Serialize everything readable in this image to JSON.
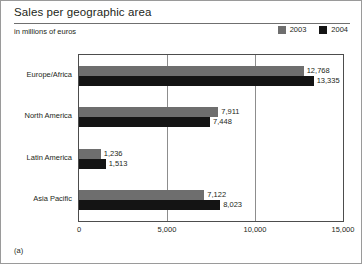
{
  "figure": {
    "title": "Sales per geographic area",
    "subtitle": "in millions of euros",
    "caption": "(a)"
  },
  "legend": {
    "position": "top-right",
    "entries": [
      {
        "label": "2003",
        "color": "#6e6e6e"
      },
      {
        "label": "2004",
        "color": "#141414"
      }
    ]
  },
  "chart_data": {
    "type": "bar",
    "orientation": "horizontal",
    "title": "Sales per geographic area",
    "subtitle": "in millions of euros",
    "xlabel": "",
    "ylabel": "",
    "xlim": [
      0,
      15000
    ],
    "xticks": [
      0,
      5000,
      10000,
      15000
    ],
    "xticklabels": [
      "0",
      "5,000",
      "10,000",
      "15,000"
    ],
    "grid": true,
    "legend_position": "top-right",
    "categories": [
      "Europe/Africa",
      "North America",
      "Latin America",
      "Asia Pacific"
    ],
    "series": [
      {
        "name": "2003",
        "color": "#6e6e6e",
        "values": [
          12768,
          7911,
          1236,
          7122
        ],
        "labels": [
          "12,768",
          "7,911",
          "1,236",
          "7,122"
        ]
      },
      {
        "name": "2004",
        "color": "#141414",
        "values": [
          13335,
          7448,
          1513,
          8023
        ],
        "labels": [
          "13,335",
          "7,448",
          "1,513",
          "8,023"
        ]
      }
    ]
  }
}
